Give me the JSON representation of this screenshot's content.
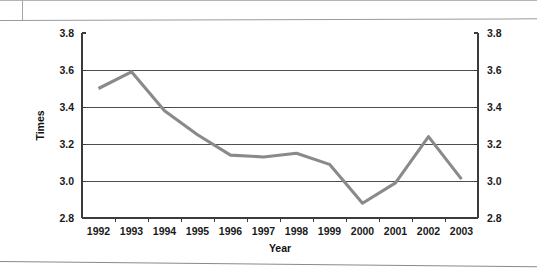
{
  "page": {
    "background_color": "#ffffff",
    "scan_artifacts": {
      "top_rule_name": "top-horizontal-rule",
      "bottom_rule_name": "bottom-horizontal-rule"
    }
  },
  "chart_data": {
    "type": "line",
    "title": "",
    "xlabel": "Year",
    "ylabel": "Times",
    "categories": [
      "1992",
      "1993",
      "1994",
      "1995",
      "1996",
      "1997",
      "1998",
      "1999",
      "2000",
      "2001",
      "2002",
      "2003"
    ],
    "values": [
      3.5,
      3.59,
      3.38,
      3.25,
      3.14,
      3.13,
      3.15,
      3.09,
      2.88,
      2.99,
      3.24,
      3.01
    ],
    "series": [
      {
        "name": "Times",
        "values": [
          3.5,
          3.59,
          3.38,
          3.25,
          3.14,
          3.13,
          3.15,
          3.09,
          2.88,
          2.99,
          3.24,
          3.01
        ],
        "color": "#8a8a8a"
      }
    ],
    "ylim": [
      2.8,
      3.8
    ],
    "ytick_step": 0.2,
    "yticks_left": [
      "3.8",
      "3.6",
      "3.4",
      "3.2",
      "3.0",
      "2.8"
    ],
    "yticks_right": [
      "3.8",
      "3.6",
      "3.4",
      "3.2",
      "3.0",
      "2.8"
    ],
    "xticks": [
      "1992",
      "1993",
      "1994",
      "1995",
      "1996",
      "1997",
      "1998",
      "1999",
      "2000",
      "2001",
      "2002",
      "2003"
    ],
    "grid": true,
    "grid_axis": "y",
    "legend": false,
    "legend_position": "none",
    "dual_y_axis": true,
    "line_color": "#8a8a8a",
    "axis_color": "#3b3b3b",
    "grid_color": "#4d4d4d",
    "markers": false
  }
}
